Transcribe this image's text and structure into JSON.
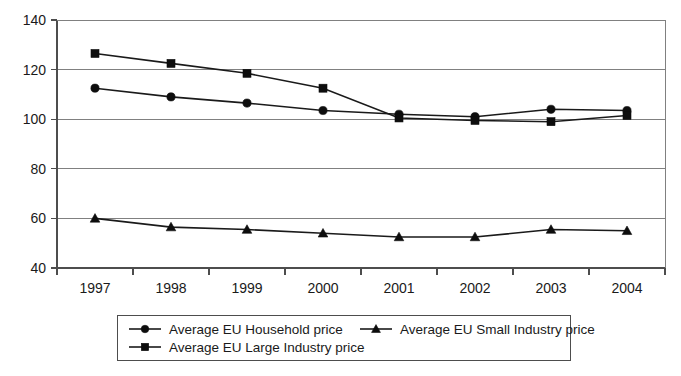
{
  "chart_data": {
    "type": "line",
    "title": "",
    "subtitle": "",
    "xlabel": "",
    "ylabel": "",
    "categories": [
      "1997",
      "1998",
      "1999",
      "2000",
      "2001",
      "2002",
      "2003",
      "2004"
    ],
    "ylim": [
      40,
      140
    ],
    "ytick_values": [
      40,
      60,
      80,
      100,
      120,
      140
    ],
    "ytick_labels": [
      "40",
      "60",
      "80",
      "100",
      "120",
      "140"
    ],
    "grid": true,
    "grid_axis": "y",
    "legend_position": "bottom",
    "series": [
      {
        "name": "Average EU Household price",
        "marker": "circle",
        "values": [
          112.5,
          109.0,
          106.5,
          103.5,
          102.0,
          101.0,
          104.0,
          103.5
        ]
      },
      {
        "name": "Average EU Small Industry price",
        "marker": "triangle",
        "values": [
          60.0,
          56.5,
          55.5,
          54.0,
          52.5,
          52.5,
          55.5,
          55.0
        ]
      },
      {
        "name": "Average EU Large Industry price",
        "marker": "square",
        "values": [
          126.5,
          122.5,
          118.5,
          112.5,
          100.5,
          99.5,
          99.0,
          101.5
        ]
      }
    ]
  },
  "legend": {
    "entries": [
      {
        "label": "Average EU Household price",
        "marker": "circle"
      },
      {
        "label": "Average EU Small Industry price",
        "marker": "triangle"
      },
      {
        "label": "Average EU Large Industry price",
        "marker": "square"
      }
    ]
  },
  "colors": {
    "series": "#0d0d0d",
    "grid": "#808080",
    "axis": "#4d4d4d",
    "text": "#1a1a1a",
    "background": "#ffffff"
  }
}
